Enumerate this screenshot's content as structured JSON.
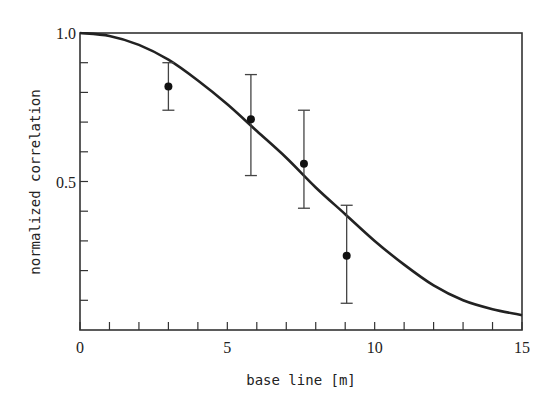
{
  "chart_data": {
    "type": "scatter",
    "title": "",
    "xlabel": "base line [m]",
    "ylabel": "normalized correlation",
    "xlim": [
      0,
      15
    ],
    "ylim": [
      0,
      1.0
    ],
    "x_tick_labels": [
      "0",
      "5",
      "10",
      "15"
    ],
    "x_major_ticks": [
      0,
      5,
      10,
      15
    ],
    "x_minor_ticks": [
      1,
      2,
      3,
      4,
      6,
      7,
      8,
      9,
      11,
      12,
      13,
      14
    ],
    "y_tick_labels": [
      "1.0",
      "0.5"
    ],
    "y_major_ticks": [
      1.0,
      0.5
    ],
    "y_minor_ticks": [
      0.9,
      0.8,
      0.7,
      0.6,
      0.4,
      0.3,
      0.2,
      0.1
    ],
    "grid": false,
    "legend": null,
    "series": [
      {
        "name": "measured",
        "kind": "points_with_error_bars",
        "points": [
          {
            "x": 3.0,
            "y": 0.82,
            "err_low": 0.74,
            "err_high": 0.9
          },
          {
            "x": 5.8,
            "y": 0.71,
            "err_low": 0.52,
            "err_high": 0.86
          },
          {
            "x": 7.6,
            "y": 0.56,
            "err_low": 0.41,
            "err_high": 0.74
          },
          {
            "x": 9.05,
            "y": 0.25,
            "err_low": 0.09,
            "err_high": 0.42
          }
        ]
      },
      {
        "name": "model",
        "kind": "line",
        "x": [
          0,
          1,
          2,
          3,
          4,
          5,
          6,
          7,
          8,
          9,
          10,
          11,
          12,
          13,
          14,
          15
        ],
        "y": [
          1.0,
          0.99,
          0.96,
          0.91,
          0.84,
          0.76,
          0.67,
          0.58,
          0.48,
          0.39,
          0.3,
          0.22,
          0.15,
          0.1,
          0.07,
          0.05
        ]
      }
    ]
  }
}
